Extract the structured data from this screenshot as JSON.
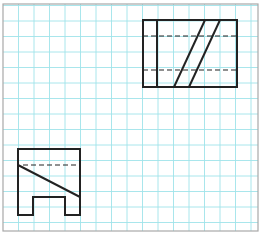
{
  "figure": {
    "colors": {
      "background": "#ffffff",
      "grid": "#9fe3ea",
      "frame": "#a8a8a8",
      "ink": "#222222"
    },
    "grid": {
      "origin_x": 3,
      "origin_y": 5.5,
      "spacing": 15.5,
      "cols": 17,
      "rows": 15
    },
    "frame": {
      "x": 3,
      "y": 4,
      "width": 255,
      "height": 227
    },
    "views": [
      {
        "name": "top-right-view",
        "outline": {
          "x": 143,
          "y": 20,
          "width": 94,
          "height": 67
        },
        "solid_lines": [
          {
            "x1": 157,
            "y1": 20,
            "x2": 157,
            "y2": 87
          },
          {
            "x1": 174,
            "y1": 87,
            "x2": 205,
            "y2": 20
          },
          {
            "x1": 189,
            "y1": 87,
            "x2": 220,
            "y2": 20
          }
        ],
        "hidden_lines": [
          {
            "x1": 143,
            "y1": 36,
            "x2": 237,
            "y2": 36
          },
          {
            "x1": 143,
            "y1": 70,
            "x2": 237,
            "y2": 70
          }
        ]
      },
      {
        "name": "bottom-left-view",
        "outline_path": "M18,149 L80,149 L80,215 L65,215 L65,197 L33,197 L33,215 L18,215 Z",
        "solid_lines": [
          {
            "x1": 18,
            "y1": 165,
            "x2": 80,
            "y2": 197
          }
        ],
        "hidden_lines": [
          {
            "x1": 23,
            "y1": 165,
            "x2": 80,
            "y2": 165
          }
        ]
      }
    ]
  }
}
